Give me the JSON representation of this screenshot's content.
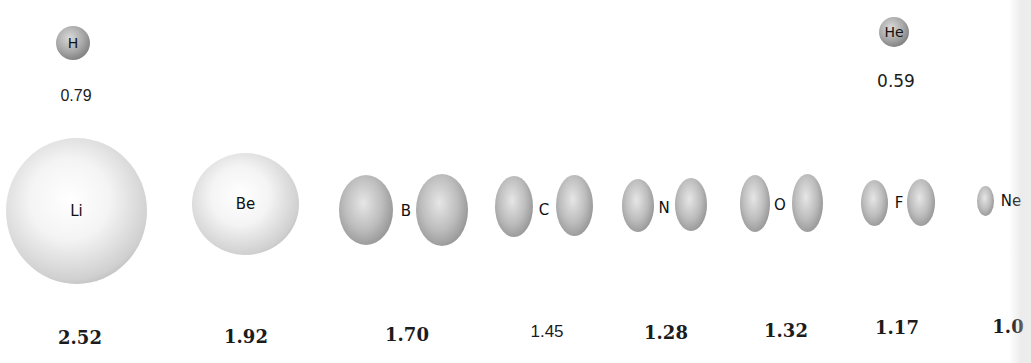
{
  "elements": [
    {
      "symbol": "H",
      "radius_label": "0.79",
      "radius": 0.79,
      "row": 1,
      "shape": "sphere"
    },
    {
      "symbol": "He",
      "radius_label": "0.59",
      "radius": 0.59,
      "row": 1,
      "shape": "sphere"
    },
    {
      "symbol": "Li",
      "radius_label": "2.52",
      "radius": 2.52,
      "row": 2,
      "shape": "sphere"
    },
    {
      "symbol": "Be",
      "radius_label": "1.92",
      "radius": 1.92,
      "row": 2,
      "shape": "sphere"
    },
    {
      "symbol": "B",
      "radius_label": "1.70",
      "radius": 1.7,
      "row": 2,
      "shape": "two-lobes"
    },
    {
      "symbol": "C",
      "radius_label": "1.45",
      "radius": 1.45,
      "row": 2,
      "shape": "two-lobes"
    },
    {
      "symbol": "N",
      "radius_label": "1.28",
      "radius": 1.28,
      "row": 2,
      "shape": "two-lobes"
    },
    {
      "symbol": "O",
      "radius_label": "1.32",
      "radius": 1.32,
      "row": 2,
      "shape": "two-lobes"
    },
    {
      "symbol": "F",
      "radius_label": "1.17",
      "radius": 1.17,
      "row": 2,
      "shape": "two-lobes"
    },
    {
      "symbol": "Ne",
      "radius_label": "1.0",
      "radius": null,
      "row": 2,
      "shape": "one-lobe-cropped"
    }
  ],
  "colors": {
    "background": "#ffffff",
    "sphere_dark": "#8a8a8a",
    "sphere_light": "#f4f4f4",
    "text": "#1a1a1a"
  }
}
